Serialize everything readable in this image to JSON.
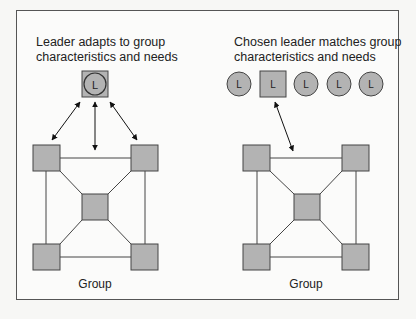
{
  "panels": [
    {
      "caption": "Leader adapts to group\ncharacteristics and needs",
      "group_label": "Group",
      "leader": {
        "shape": "circle-in-square",
        "label": "L"
      }
    },
    {
      "caption": "Chosen leader matches group\ncharacteristics and needs",
      "group_label": "Group",
      "leaders": [
        {
          "shape": "circle",
          "label": "L"
        },
        {
          "shape": "square",
          "label": "L",
          "chosen": true
        },
        {
          "shape": "circle",
          "label": "L"
        },
        {
          "shape": "circle",
          "label": "L"
        },
        {
          "shape": "circle",
          "label": "L"
        }
      ]
    }
  ],
  "colors": {
    "fill": "#b3b3b3",
    "stroke": "#444444",
    "frame": "#555555"
  }
}
